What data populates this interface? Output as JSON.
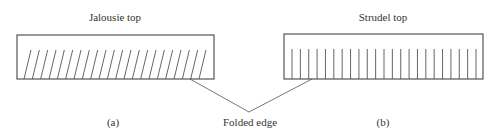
{
  "diagram": {
    "panels": [
      {
        "id": "a",
        "title": "Jalousie top",
        "caption": "(a)",
        "pattern": "diagonal-slits",
        "slit_count": 22,
        "rect": {
          "x": 17,
          "y": 35,
          "w": 197,
          "h": 44
        }
      },
      {
        "id": "b",
        "title": "Strudel top",
        "caption": "(b)",
        "pattern": "vertical-slits",
        "slit_count": 23,
        "rect": {
          "x": 284,
          "y": 34,
          "w": 199,
          "h": 45
        }
      }
    ],
    "callout": {
      "label": "Folded edge",
      "apex": {
        "x": 249,
        "y": 112
      },
      "targets": [
        {
          "x": 190,
          "y": 79
        },
        {
          "x": 312,
          "y": 79
        }
      ]
    },
    "colors": {
      "stroke": "#555555",
      "text": "#333333",
      "background": "#ffffff"
    }
  }
}
